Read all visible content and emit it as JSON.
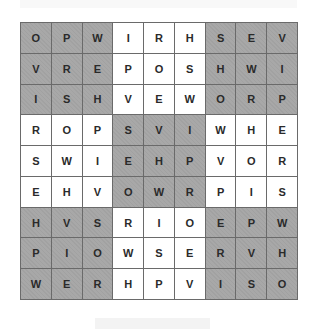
{
  "puzzle": {
    "type": "sudoku-letters",
    "size": 9,
    "rows": [
      [
        "O",
        "P",
        "W",
        "I",
        "R",
        "H",
        "S",
        "E",
        "V"
      ],
      [
        "V",
        "R",
        "E",
        "P",
        "O",
        "S",
        "H",
        "W",
        "I"
      ],
      [
        "I",
        "S",
        "H",
        "V",
        "E",
        "W",
        "O",
        "R",
        "P"
      ],
      [
        "R",
        "O",
        "P",
        "S",
        "V",
        "I",
        "W",
        "H",
        "E"
      ],
      [
        "S",
        "W",
        "I",
        "E",
        "H",
        "P",
        "V",
        "O",
        "R"
      ],
      [
        "E",
        "H",
        "V",
        "O",
        "W",
        "R",
        "P",
        "I",
        "S"
      ],
      [
        "H",
        "V",
        "S",
        "R",
        "I",
        "O",
        "E",
        "P",
        "W"
      ],
      [
        "P",
        "I",
        "O",
        "W",
        "S",
        "E",
        "R",
        "V",
        "H"
      ],
      [
        "W",
        "E",
        "R",
        "H",
        "P",
        "V",
        "I",
        "S",
        "O"
      ]
    ],
    "box_shading": [
      [
        "dark",
        "light",
        "dark"
      ],
      [
        "light",
        "dark",
        "light"
      ],
      [
        "dark",
        "light",
        "dark"
      ]
    ],
    "colors": {
      "dark": "#a8a8a8",
      "light": "#ffffff",
      "grid_line": "#6a6a6a",
      "letter": "#2a2a2a"
    }
  }
}
